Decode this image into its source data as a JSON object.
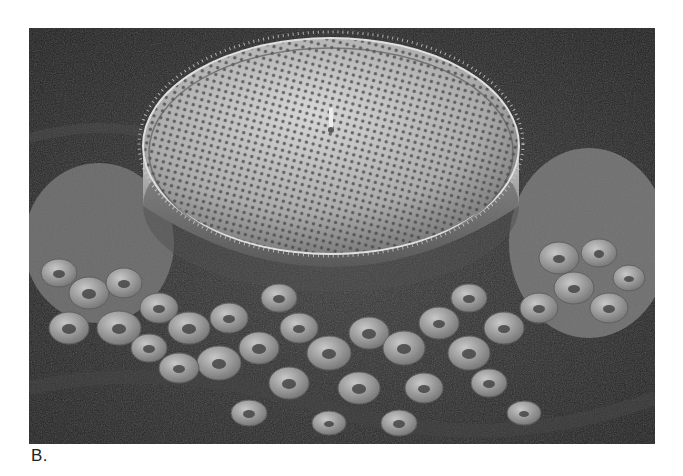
{
  "figure": {
    "panel_label": "B.",
    "image_description": "Grayscale scanning electron micrograph of a disc-shaped diatom with a perforated, spiny dome resting on a mound of biconcave red blood cells",
    "colors": {
      "page_background": "#ffffff",
      "photo_background": "#2b2b2b",
      "diatom_face": "#bdbdbd",
      "cell_fill": "#9a9a9a",
      "label_text": "#222222"
    }
  }
}
